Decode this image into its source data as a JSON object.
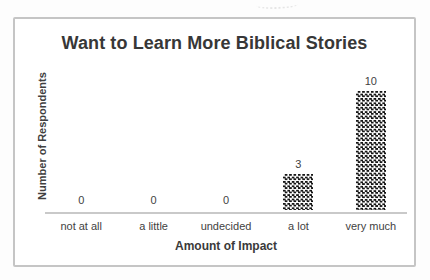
{
  "chart_data": {
    "type": "bar",
    "title": "Want to Learn More Biblical Stories",
    "xlabel": "Amount of Impact",
    "ylabel": "Number of Respondents",
    "categories": [
      "not at all",
      "a little",
      "undecided",
      "a lot",
      "very much"
    ],
    "values": [
      0,
      0,
      0,
      3,
      10
    ],
    "data_labels": [
      0,
      0,
      0,
      3,
      10
    ],
    "ylim": [
      0,
      10
    ],
    "grid": false,
    "legend": false,
    "bar_fill_pattern": "dark-trellis-checkerboard",
    "bar_pattern_color": "#161616",
    "axis_line_color": "#c9c9c9",
    "frame_border_color": "#c5c5c5",
    "text_color": "#3a3a3a",
    "background_color": "#ffffff"
  }
}
